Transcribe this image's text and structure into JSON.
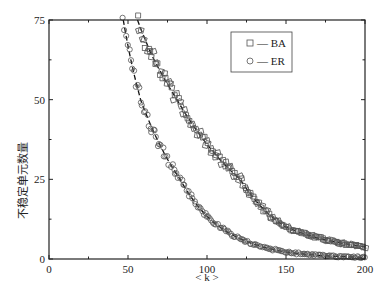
{
  "chart_data": {
    "type": "scatter",
    "title": "",
    "xlabel": "< k >",
    "ylabel": "不稳定单元数量",
    "xlim": [
      0,
      200
    ],
    "ylim": [
      0,
      75
    ],
    "x_ticks": [
      0,
      50,
      100,
      150,
      200
    ],
    "x_tick_labels": [
      "0",
      "50",
      "100",
      "150",
      "200"
    ],
    "x_minor_ticks": [
      25,
      75,
      125,
      175
    ],
    "y_ticks": [
      0,
      25,
      50,
      75
    ],
    "y_tick_labels": [
      "0",
      "25",
      "50",
      "75"
    ],
    "y_minor_ticks": [
      12.5,
      37.5,
      62.5
    ],
    "grid": false,
    "legend": {
      "placement": "top-right",
      "entries": [
        {
          "label": "— BA",
          "marker": "square"
        },
        {
          "label": "— ER",
          "marker": "circle"
        }
      ]
    },
    "series": [
      {
        "name": "BA",
        "marker": "square",
        "fit": "dashed",
        "anchors": {
          "x": [
            56,
            65,
            81,
            100,
            121,
            150,
            175,
            200
          ],
          "y": [
            75,
            64,
            50,
            36,
            25,
            10,
            6,
            3.8
          ]
        }
      },
      {
        "name": "ER",
        "marker": "circle",
        "fit": "dashed",
        "anchors": {
          "x": [
            47,
            52,
            58,
            70,
            83,
            102,
            125,
            150,
            175,
            200
          ],
          "y": [
            75,
            62,
            50,
            36,
            25,
            12.5,
            5.5,
            2.2,
            1.0,
            0.5
          ]
        }
      }
    ]
  }
}
